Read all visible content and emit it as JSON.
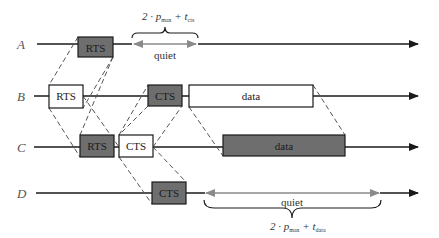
{
  "diagram": {
    "nodes": [
      {
        "id": "A",
        "label": "A",
        "y": 44
      },
      {
        "id": "B",
        "label": "B",
        "y": 96
      },
      {
        "id": "C",
        "label": "C",
        "y": 147
      },
      {
        "id": "D",
        "label": "D",
        "y": 193
      }
    ],
    "frames": {
      "A_rts": {
        "label": "RTS",
        "fill": "#6e6e6e"
      },
      "B_rts": {
        "label": "RTS",
        "fill": "#ffffff"
      },
      "B_cts": {
        "label": "CTS",
        "fill": "#6e6e6e"
      },
      "B_data": {
        "label": "data",
        "fill": "#ffffff"
      },
      "C_rts": {
        "label": "RTS",
        "fill": "#6e6e6e"
      },
      "C_cts": {
        "label": "CTS",
        "fill": "#ffffff"
      },
      "C_data": {
        "label": "data",
        "fill": "#6e6e6e"
      },
      "D_cts": {
        "label": "CTS",
        "fill": "#6e6e6e"
      }
    },
    "quiet_A": {
      "label": "quiet",
      "formula_prefix": "2 · p",
      "formula_sub1": "max",
      "formula_mid": " + t",
      "formula_sub2": "cts"
    },
    "quiet_D": {
      "label": "quiet",
      "formula_prefix": "2 · p",
      "formula_sub1": "max",
      "formula_mid": " + t",
      "formula_sub2": "data"
    },
    "colors": {
      "line": "#1a1a1a",
      "dashed": "#555555",
      "quiet_arrow": "#8a8a8a",
      "dark_frame": "#6e6e6e"
    }
  }
}
